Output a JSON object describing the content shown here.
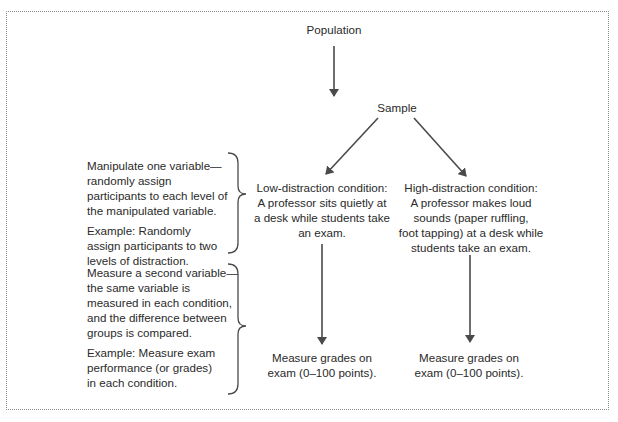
{
  "diagram": {
    "nodes": {
      "population": "Population",
      "sample": "Sample",
      "low_condition": [
        "Low-distraction condition:",
        "A professor sits quietly at",
        "a desk while students take",
        "an exam."
      ],
      "high_condition": [
        "High-distraction condition:",
        "A professor makes loud",
        "sounds (paper ruffling,",
        "foot tapping) at a desk while",
        "students take an exam."
      ],
      "low_measure": [
        "Measure grades on",
        "exam (0–100 points)."
      ],
      "high_measure": [
        "Measure grades on",
        "exam (0–100 points)."
      ]
    },
    "annotations": {
      "manipulate": {
        "description": [
          "Manipulate one variable—",
          "randomly assign",
          "participants to each level of",
          "the manipulated variable."
        ],
        "example": [
          "Example: Randomly",
          "assign participants to two",
          "levels of distraction."
        ]
      },
      "measure": {
        "description": [
          "Measure a second variable—",
          "the same variable is",
          "measured in each condition,",
          "and the difference between",
          "groups is compared."
        ],
        "example": [
          "Example: Measure exam",
          "performance (or grades)",
          "in each condition."
        ]
      }
    },
    "colors": {
      "line": "#4a4a4a",
      "text": "#2a2a2a",
      "frame": "#8a8a8a"
    }
  }
}
